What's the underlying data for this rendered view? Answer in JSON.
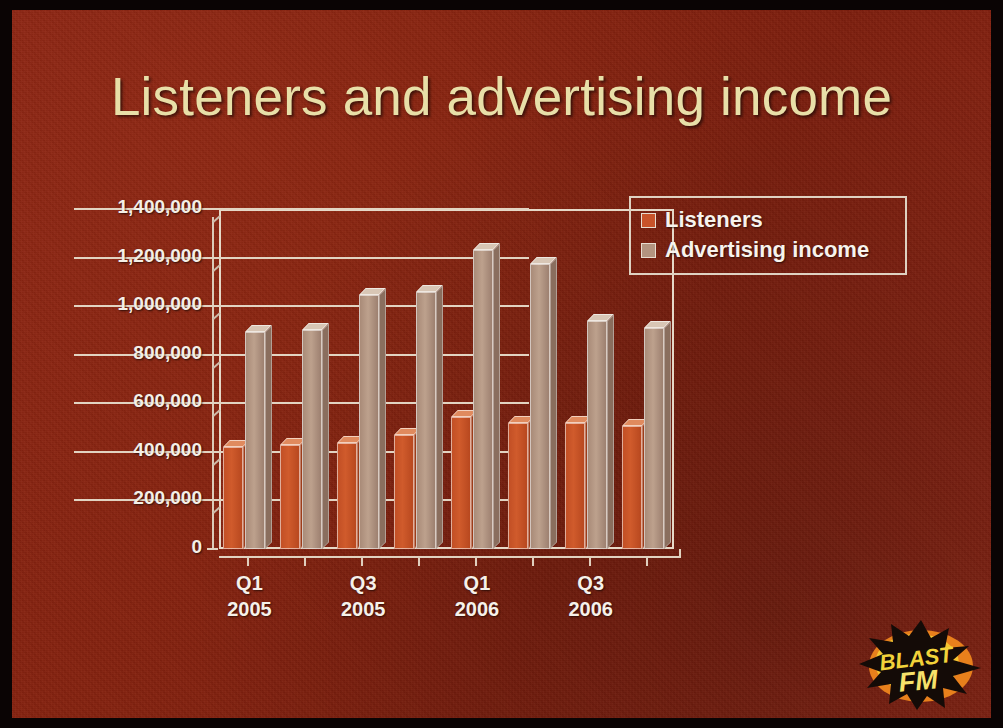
{
  "slide": {
    "title": "Listeners and advertising income",
    "background_color": "#85220f",
    "title_color": "#e8dfa8"
  },
  "logo": {
    "name": "blast-fm-logo",
    "line1": "BLAST",
    "line2": "FM",
    "text_color": "#f2d23a",
    "burst_color": "#120a06",
    "ellipse_color": "#e8801c"
  },
  "legend": {
    "items": [
      {
        "label": "Listeners",
        "color": "#c8532a"
      },
      {
        "label": "Advertising income",
        "color": "#b39480"
      }
    ]
  },
  "chart_data": {
    "type": "bar",
    "title": "Listeners and advertising income",
    "xlabel": "",
    "ylabel": "",
    "ylim": [
      0,
      1400000
    ],
    "ytick_labels": [
      "1,400,000",
      "1,200,000",
      "1,000,000",
      "800,000",
      "600,000",
      "400,000",
      "200,000",
      "0"
    ],
    "ytick_values": [
      1400000,
      1200000,
      1000000,
      800000,
      600000,
      400000,
      200000,
      0
    ],
    "grid": true,
    "legend_position": "right",
    "categories": [
      "Q1 2005",
      "Q2 2005",
      "Q3 2005",
      "Q4 2005",
      "Q1 2006",
      "Q2 2006",
      "Q3 2006",
      "Q4 2006"
    ],
    "xtick_labels": [
      {
        "quarter": "Q1",
        "year": "2005"
      },
      {
        "quarter": "Q3",
        "year": "2005"
      },
      {
        "quarter": "Q1",
        "year": "2006"
      },
      {
        "quarter": "Q3",
        "year": "2006"
      }
    ],
    "series": [
      {
        "name": "Listeners",
        "color": "#c8532a",
        "values": [
          420000,
          430000,
          435000,
          470000,
          545000,
          520000,
          520000,
          505000
        ]
      },
      {
        "name": "Advertising income",
        "color": "#b39480",
        "values": [
          895000,
          900000,
          1045000,
          1060000,
          1230000,
          1175000,
          940000,
          910000
        ]
      }
    ]
  }
}
